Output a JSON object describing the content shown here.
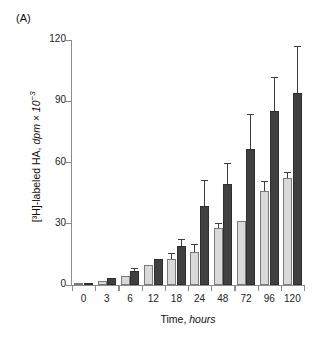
{
  "panel": {
    "label": "(A)"
  },
  "chart_data": {
    "type": "bar",
    "title": "",
    "xlabel": "Time, hours",
    "xlabel_plain": "Time,",
    "xlabel_italic": "hours",
    "ylabel": "[3H]-labeled HA, dpm × 10-3",
    "ylabel_prefix": "[³H]-labeled HA, ",
    "ylabel_italic": "dpm × 10",
    "ylabel_sup": "−3",
    "categories": [
      "0",
      "3",
      "6",
      "12",
      "18",
      "24",
      "48",
      "72",
      "96",
      "120"
    ],
    "xticklabels": [
      "0",
      "3",
      "6",
      "12",
      "18",
      "24",
      "48",
      "72",
      "96",
      "120"
    ],
    "yticklabels": [
      "0",
      "30",
      "60",
      "90",
      "120"
    ],
    "ytickvalues": [
      0,
      30,
      60,
      90,
      120
    ],
    "ylim": [
      0,
      120
    ],
    "grid": false,
    "legend": "none",
    "series": [
      {
        "name": "light-gray-series",
        "color": "#d9d9d9",
        "values": [
          0.5,
          2.0,
          4.5,
          10.0,
          12.5,
          16.0,
          28.0,
          31.5,
          46.0,
          52.5
        ],
        "errors": [
          0.0,
          0.0,
          0.0,
          0.0,
          3.0,
          4.0,
          2.5,
          0.0,
          5.0,
          3.0
        ]
      },
      {
        "name": "dark-gray-series",
        "color": "#404040",
        "values": [
          0.8,
          3.5,
          7.0,
          12.5,
          19.0,
          38.5,
          49.5,
          66.5,
          85.0,
          94.0
        ],
        "errors": [
          0.0,
          0.0,
          1.5,
          0.0,
          3.5,
          13.0,
          10.5,
          17.5,
          17.0,
          23.0
        ]
      }
    ]
  },
  "colors": {
    "light_bar": "#d9d9d9",
    "dark_bar": "#404040",
    "axis": "#8c8c8c",
    "text": "#1a1a1a",
    "background": "#ffffff"
  }
}
